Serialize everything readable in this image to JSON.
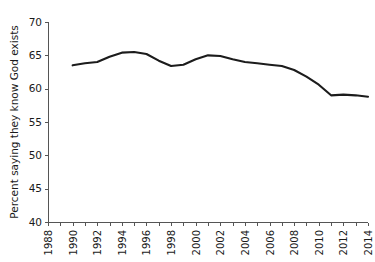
{
  "chart_data": {
    "type": "line",
    "title": "",
    "subtitle": "",
    "xlabel": "",
    "ylabel": "Percent saying they know God exists",
    "xlim": [
      1988,
      2014
    ],
    "ylim": [
      40,
      70
    ],
    "yticks": [
      40,
      45,
      50,
      55,
      60,
      65,
      70
    ],
    "xticks": [
      1988,
      1989,
      1990,
      1991,
      1992,
      1993,
      1994,
      1995,
      1996,
      1997,
      1998,
      1999,
      2000,
      2001,
      2002,
      2003,
      2004,
      2005,
      2006,
      2007,
      2008,
      2009,
      2010,
      2011,
      2012,
      2013,
      2014
    ],
    "xtick_labels": [
      "1988",
      "",
      "1990",
      "",
      "1992",
      "",
      "1994",
      "",
      "1996",
      "",
      "1998",
      "",
      "2000",
      "",
      "2002",
      "",
      "2004",
      "",
      "2006",
      "",
      "2008",
      "",
      "2010",
      "",
      "2012",
      "",
      "2014"
    ],
    "grid": false,
    "legend": false,
    "line_color": "#1c1c1c",
    "series": [
      {
        "name": "Percent saying they know God exists",
        "x": [
          1990,
          1991,
          1992,
          1993,
          1994,
          1995,
          1996,
          1997,
          1998,
          1999,
          2000,
          2001,
          2002,
          2003,
          2004,
          2005,
          2006,
          2007,
          2008,
          2009,
          2010,
          2011,
          2012,
          2013,
          2014
        ],
        "values": [
          63.5,
          63.8,
          64.0,
          64.8,
          65.4,
          65.5,
          65.2,
          64.2,
          63.4,
          63.6,
          64.4,
          65.0,
          64.9,
          64.4,
          64.0,
          63.8,
          63.6,
          63.4,
          62.8,
          61.8,
          60.6,
          59.0,
          59.1,
          59.0,
          58.8
        ]
      }
    ]
  },
  "axis": {
    "ylabel": "Percent saying they know God exists",
    "ytick_labels": [
      "70",
      "65",
      "60",
      "55",
      "50",
      "45",
      "40"
    ],
    "xtick_labels_visible": [
      "1988",
      "1990",
      "1992",
      "1994",
      "1996",
      "1998",
      "2000",
      "2002",
      "2004",
      "2006",
      "2008",
      "2010",
      "2012",
      "2014"
    ]
  }
}
